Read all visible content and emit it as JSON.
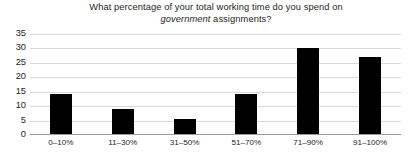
{
  "chart_data": {
    "type": "bar",
    "title": "What percentage of your total working time do you spend on government assignments?",
    "title_line1": "What percentage of your total working time do you spend on",
    "title_line2_italic": "government",
    "title_line2_rest": " assignments?",
    "categories": [
      "0–10%",
      "11–30%",
      "31–50%",
      "51–70%",
      "71–90%",
      "91–100%"
    ],
    "values": [
      14,
      9,
      5.5,
      14,
      30,
      27
    ],
    "xlabel": "",
    "ylabel": "",
    "ylim": [
      0,
      35
    ],
    "yticks": [
      0,
      5,
      10,
      15,
      20,
      25,
      30,
      35
    ],
    "ytick_labels": [
      "0",
      "5",
      "10",
      "15",
      "20",
      "25",
      "30",
      "35"
    ],
    "grid": true,
    "legend": false,
    "bar_color": "#000000",
    "grid_color": "#d9d9d9",
    "axis_color": "#9a9a9a",
    "text_color": "#231f20"
  }
}
